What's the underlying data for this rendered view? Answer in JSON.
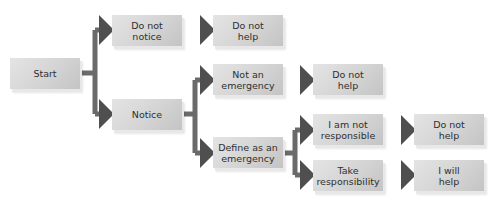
{
  "diagram": {
    "type": "flowchart",
    "title": "",
    "colors": {
      "box_light": "#e4e4e4",
      "box_dark": "#c4c4c4",
      "text": "#2f2f2f",
      "connector": "#5e5e5e"
    },
    "nodes": {
      "start": {
        "label": "Start"
      },
      "do_not_notice": {
        "label": "Do not\nnotice"
      },
      "do_not_help_1": {
        "label": "Do not\nhelp"
      },
      "notice": {
        "label": "Notice"
      },
      "not_an_emergency": {
        "label": "Not an\nemergency"
      },
      "do_not_help_2": {
        "label": "Do not\nhelp"
      },
      "define_as_emergency": {
        "label": "Define as an\nemergency"
      },
      "i_am_not_responsible": {
        "label": "I am not\nresponsible"
      },
      "do_not_help_3": {
        "label": "Do not\nhelp"
      },
      "take_responsibility": {
        "label": "Take\nresponsibility"
      },
      "i_will_help": {
        "label": "I will\nhelp"
      }
    },
    "edges": [
      {
        "from": "Start",
        "to": "Do not notice"
      },
      {
        "from": "Start",
        "to": "Notice"
      },
      {
        "from": "Do not notice",
        "to": "Do not help"
      },
      {
        "from": "Notice",
        "to": "Not an emergency"
      },
      {
        "from": "Notice",
        "to": "Define as an emergency"
      },
      {
        "from": "Not an emergency",
        "to": "Do not help"
      },
      {
        "from": "Define as an emergency",
        "to": "I am not responsible"
      },
      {
        "from": "Define as an emergency",
        "to": "Take responsibility"
      },
      {
        "from": "I am not responsible",
        "to": "Do not help"
      },
      {
        "from": "Take responsibility",
        "to": "I will help"
      }
    ]
  }
}
